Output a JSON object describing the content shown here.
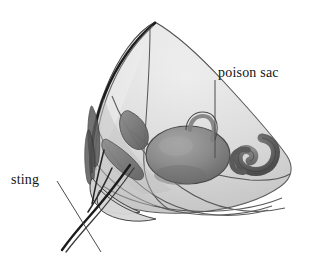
{
  "figure": {
    "kind": "anatomical-illustration",
    "background_color": "#ffffff",
    "palette": {
      "body_fill_light": "#ececec",
      "body_fill_mid": "#d8d8d8",
      "body_fill_shadow": "#c2c2c2",
      "organ_fill": "#8a8a8a",
      "organ_fill_dark": "#6f6f6f",
      "organ_highlight": "#a8a8a8",
      "outline": "#3a3a3a",
      "outline_soft": "#6b6b6b",
      "sting_dark": "#222222",
      "leader_line": "#4a4a4a",
      "text": "#141414"
    }
  },
  "labels": [
    {
      "id": "poison-sac",
      "text": "poison sac",
      "x": 218,
      "y": 66,
      "leader": {
        "from_x": 215,
        "from_y": 80,
        "to_x": 215,
        "to_y": 158,
        "style": "vertical-straight"
      }
    },
    {
      "id": "sting",
      "text": "sting",
      "x": 11,
      "y": 173,
      "leader": {
        "from_x": 57,
        "from_y": 181,
        "to_x": 101,
        "to_y": 252,
        "style": "diagonal-straight"
      }
    }
  ],
  "structures": [
    {
      "name": "abdominal-cone-outer-wall",
      "description": "translucent conical outer wall of the abdomen tip"
    },
    {
      "name": "poison-sac",
      "description": "large dark ovoid venom reservoir with narrow curved duct"
    },
    {
      "name": "venom-duct",
      "description": "slender tube rising from the poison sac toward the apex"
    },
    {
      "name": "sting-shaft",
      "description": "dark slender needle projecting from the lower left"
    },
    {
      "name": "sting-bulb",
      "description": "hook-shaped organ to the right of the poison sac"
    },
    {
      "name": "lateral-lobes",
      "description": "elongated dark lobes on the left inner wall"
    }
  ]
}
